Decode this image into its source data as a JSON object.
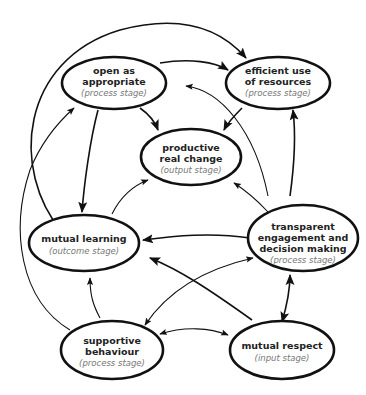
{
  "diagram": {
    "nodes": [
      {
        "id": "open",
        "lines": [
          "open as",
          "appropriate"
        ],
        "stage": "(process stage)"
      },
      {
        "id": "efficient",
        "lines": [
          "efficient use",
          "of resources"
        ],
        "stage": "(process stage)"
      },
      {
        "id": "productive",
        "lines": [
          "productive",
          "real change"
        ],
        "stage": "(output stage)"
      },
      {
        "id": "learning",
        "lines": [
          "mutual learning"
        ],
        "stage": "(outcome stage)"
      },
      {
        "id": "transparent",
        "lines": [
          "transparent",
          "engagement and",
          "decision making"
        ],
        "stage": "(process stage)"
      },
      {
        "id": "supportive",
        "lines": [
          "supportive",
          "behaviour"
        ],
        "stage": "(process stage)"
      },
      {
        "id": "respect",
        "lines": [
          "mutual respect"
        ],
        "stage": "(input stage)"
      }
    ],
    "edges": [
      {
        "from": "open",
        "to": "efficient"
      },
      {
        "from": "open",
        "to": "productive"
      },
      {
        "from": "open",
        "to": "learning"
      },
      {
        "from": "efficient",
        "to": "productive"
      },
      {
        "from": "learning",
        "to": "productive"
      },
      {
        "from": "learning",
        "to": "efficient"
      },
      {
        "from": "transparent",
        "to": "productive"
      },
      {
        "from": "transparent",
        "to": "efficient"
      },
      {
        "from": "transparent",
        "to": "open"
      },
      {
        "from": "transparent",
        "to": "learning"
      },
      {
        "from": "transparent",
        "to": "supportive",
        "bidirectional": true
      },
      {
        "from": "respect",
        "to": "transparent",
        "bidirectional": true
      },
      {
        "from": "respect",
        "to": "learning"
      },
      {
        "from": "supportive",
        "to": "respect",
        "bidirectional": true
      },
      {
        "from": "supportive",
        "to": "learning"
      },
      {
        "from": "supportive",
        "to": "open"
      },
      {
        "from": "learning",
        "to": "efficient",
        "outer": true
      }
    ]
  }
}
